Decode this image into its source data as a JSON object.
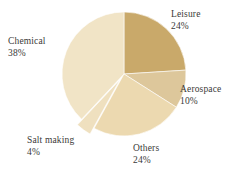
{
  "chart_data": {
    "type": "pie",
    "title": "",
    "subtitle": "",
    "xlabel": "",
    "ylabel": "",
    "legend_position": "none",
    "grid": false,
    "labels_show_percent": true,
    "categories": [
      "Leisure",
      "Aerospace",
      "Others",
      "Salt making",
      "Chemical"
    ],
    "values": [
      24,
      10,
      24,
      4,
      38
    ],
    "units": "%",
    "slices": [
      {
        "name": "Leisure",
        "value": 24,
        "percent_text": "24%",
        "color": "#c9a96a",
        "exploded": false,
        "label_name": "Leisure",
        "label_value": "24%"
      },
      {
        "name": "Aerospace",
        "value": 10,
        "percent_text": "10%",
        "color": "#ddc79b",
        "exploded": false,
        "label_name": "Aerospace",
        "label_value": "10%"
      },
      {
        "name": "Others",
        "value": 24,
        "percent_text": "24%",
        "color": "#ecd9b0",
        "exploded": false,
        "label_name": "Others",
        "label_value": "24%"
      },
      {
        "name": "Salt making",
        "value": 4,
        "percent_text": "4%",
        "color": "#efe0bf",
        "exploded": true,
        "label_name": "Salt making",
        "label_value": "4%"
      },
      {
        "name": "Chemical",
        "value": 38,
        "percent_text": "38%",
        "color": "#f1e4c6",
        "exploded": false,
        "label_name": "Chemical",
        "label_value": "38%"
      }
    ],
    "colors": {
      "background": "#ffffff",
      "text": "#3a3a38",
      "slice_leisure": "#c9a96a",
      "slice_aerospace": "#ddc79b",
      "slice_others": "#ecd9b0",
      "slice_salt_making": "#efe0bf",
      "slice_chemical": "#f1e4c6"
    }
  }
}
